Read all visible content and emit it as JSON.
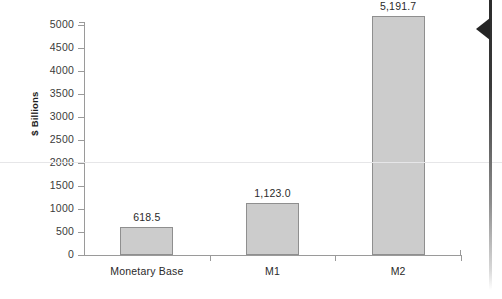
{
  "chart_data": {
    "type": "bar",
    "title": "",
    "xlabel": "",
    "ylabel": "$ Billions",
    "categories": [
      "Monetary Base",
      "M1",
      "M2"
    ],
    "values": [
      618.5,
      1123.0,
      5191.7
    ],
    "value_labels": [
      "618.5",
      "1,123.0",
      "5,191.7"
    ],
    "ylim": [
      0,
      5000
    ],
    "ytick_values": [
      0,
      500,
      1000,
      1500,
      2000,
      2500,
      3000,
      3500,
      4000,
      4500,
      5000
    ],
    "ytick_labels": [
      "0",
      "500",
      "1000",
      "1500",
      "2000",
      "2500",
      "3000",
      "3500",
      "4000",
      "4500",
      "5000"
    ],
    "grid": false,
    "legend": "none",
    "bar_fill_color": "#cccccc",
    "bar_border_color": "#8f8f8f",
    "axis_color": "#9a9a9a",
    "text_color": "#2a2a2a"
  },
  "artifacts": {
    "scan_edge_color": "#2b2b2b",
    "scan_line_color": "#e6e6e8"
  }
}
